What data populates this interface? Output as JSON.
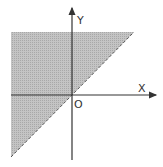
{
  "diagram": {
    "axis_labels": {
      "x": "X",
      "y": "Y",
      "origin": "O"
    },
    "boundary": {
      "equation": "y = x",
      "style": "dashed"
    },
    "shaded_region": "y >= x",
    "colors": {
      "shade": "#b9b9b9",
      "axis": "#333333",
      "boundary": "#555555"
    }
  }
}
